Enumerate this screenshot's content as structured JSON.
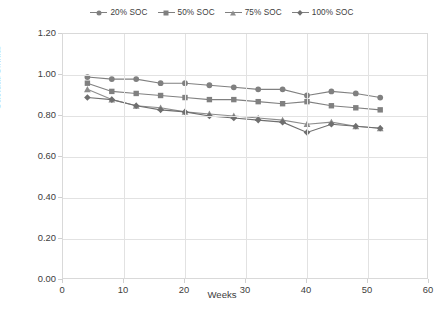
{
  "chart_data": {
    "type": "line",
    "title": "",
    "xlabel": "Weeks",
    "ylabel": "Cactual/Cinitial",
    "xlim": [
      0,
      60
    ],
    "ylim": [
      0.0,
      1.2
    ],
    "xticks": [
      "0",
      "10",
      "20",
      "30",
      "40",
      "50",
      "60"
    ],
    "yticks": [
      "0.00",
      "0.20",
      "0.40",
      "0.60",
      "0.80",
      "1.00",
      "1.20"
    ],
    "grid": true,
    "legend_position": "top-center",
    "x": [
      4,
      8,
      12,
      16,
      20,
      24,
      28,
      32,
      36,
      40,
      44,
      48,
      52
    ],
    "series": [
      {
        "name": "20% SOC",
        "marker": "circle",
        "color": "#808080",
        "values": [
          0.99,
          0.98,
          0.98,
          0.96,
          0.96,
          0.95,
          0.94,
          0.93,
          0.93,
          0.9,
          0.92,
          0.91,
          0.89
        ]
      },
      {
        "name": "50% SOC",
        "marker": "square",
        "color": "#808080",
        "values": [
          0.96,
          0.92,
          0.91,
          0.9,
          0.89,
          0.88,
          0.88,
          0.87,
          0.86,
          0.87,
          0.85,
          0.84,
          0.83
        ]
      },
      {
        "name": "75% SOC",
        "marker": "triangle",
        "color": "#8d8d8d",
        "values": [
          0.93,
          0.88,
          0.85,
          0.84,
          0.82,
          0.81,
          0.8,
          0.79,
          0.78,
          0.76,
          0.77,
          0.75,
          0.74
        ]
      },
      {
        "name": "100% SOC",
        "marker": "diamond",
        "color": "#6f6f6f",
        "values": [
          0.89,
          0.88,
          0.85,
          0.83,
          0.82,
          0.8,
          0.79,
          0.78,
          0.77,
          0.72,
          0.76,
          0.75,
          0.74
        ]
      }
    ]
  },
  "legend": {
    "items": [
      {
        "label": "20% SOC"
      },
      {
        "label": "50% SOC"
      },
      {
        "label": "75% SOC"
      },
      {
        "label": "100% SOC"
      }
    ]
  },
  "caption": {
    "text": ""
  }
}
